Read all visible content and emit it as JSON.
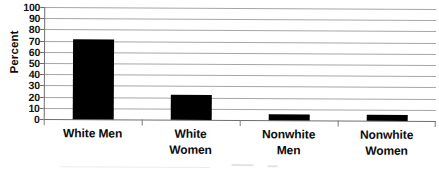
{
  "chart_data": {
    "type": "bar",
    "title": "",
    "xlabel": "",
    "ylabel": "Percent",
    "ylim": [
      0,
      100
    ],
    "ytick_step": 10,
    "yticks": [
      100,
      90,
      80,
      70,
      60,
      50,
      40,
      30,
      20,
      10,
      0
    ],
    "grid": true,
    "legend": false,
    "bar_color": "#000000",
    "categories": [
      "White Men",
      "White Women",
      "Nonwhite Men",
      "Nonwhite Women"
    ],
    "category_lines": [
      [
        "White Men",
        ""
      ],
      [
        "White",
        "Women"
      ],
      [
        "Nonwhite",
        "Men"
      ],
      [
        "Nonwhite",
        "Women"
      ]
    ],
    "values": [
      71,
      22,
      5,
      5
    ]
  },
  "axis": {
    "y_title": "Percent"
  }
}
